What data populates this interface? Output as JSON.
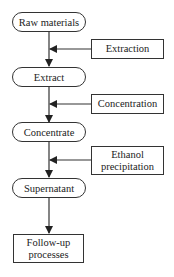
{
  "diagram": {
    "type": "flowchart",
    "main_steps": [
      {
        "label": "Raw materials"
      },
      {
        "label": "Extract"
      },
      {
        "label": "Concentrate"
      },
      {
        "label": "Supernatant"
      }
    ],
    "processes": [
      {
        "line1": "Extraction",
        "line2": ""
      },
      {
        "line1": "Concentration",
        "line2": ""
      },
      {
        "line1": "Ethanol",
        "line2": "precipitation"
      }
    ],
    "final_step": {
      "line1": "Follow-up",
      "line2": "processes"
    }
  }
}
